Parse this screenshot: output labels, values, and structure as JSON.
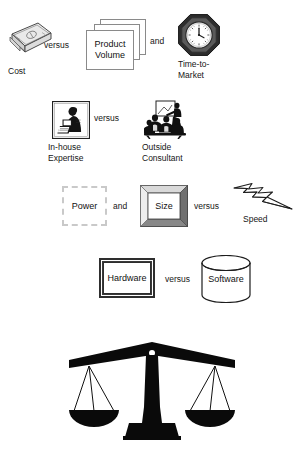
{
  "diagram": {
    "background_color": "#ffffff",
    "text_color": "#161616",
    "rows": [
      {
        "id": "row-cost-volume-time",
        "items": [
          {
            "id": "cost",
            "label": "Cost",
            "icon": "money-icon"
          },
          {
            "id": "connector-1",
            "label": "versus",
            "type": "connector"
          },
          {
            "id": "product-volume",
            "label": "Product\nVolume",
            "icon": "stacked-pages-icon"
          },
          {
            "id": "connector-2",
            "label": "and",
            "type": "connector"
          },
          {
            "id": "time-to-market",
            "label": "Time-to-\nMarket",
            "icon": "clock-icon"
          }
        ]
      },
      {
        "id": "row-expertise",
        "items": [
          {
            "id": "in-house",
            "label": "In-house\nExpertise",
            "icon": "person-at-computer-icon"
          },
          {
            "id": "connector-3",
            "label": "versus",
            "type": "connector"
          },
          {
            "id": "outside",
            "label": "Outside\nConsultant",
            "icon": "group-presentation-icon"
          }
        ]
      },
      {
        "id": "row-power-size-speed",
        "items": [
          {
            "id": "power",
            "label": "Power",
            "icon": "dashed-box-icon"
          },
          {
            "id": "connector-4",
            "label": "and",
            "type": "connector"
          },
          {
            "id": "size",
            "label": "Size",
            "icon": "beveled-frame-icon"
          },
          {
            "id": "connector-5",
            "label": "versus",
            "type": "connector"
          },
          {
            "id": "speed",
            "label": "Speed",
            "icon": "lightning-bolt-icon"
          }
        ]
      },
      {
        "id": "row-hardware-software",
        "items": [
          {
            "id": "hardware",
            "label": "Hardware",
            "icon": "double-border-box-icon"
          },
          {
            "id": "connector-6",
            "label": "versus",
            "type": "connector"
          },
          {
            "id": "software",
            "label": "Software",
            "icon": "cylinder-icon"
          }
        ]
      }
    ],
    "footer_graphic": {
      "id": "balance-scale",
      "icon": "balance-scale-icon",
      "color": "#000000"
    }
  },
  "labels": {
    "cost": "Cost",
    "product_volume": "Product\nVolume",
    "time_to_market": "Time-to-\nMarket",
    "in_house": "In-house\nExpertise",
    "outside_consultant": "Outside\nConsultant",
    "power": "Power",
    "size": "Size",
    "speed": "Speed",
    "hardware": "Hardware",
    "software": "Software"
  },
  "connectors": {
    "versus_1": "versus",
    "and_1": "and",
    "versus_2": "versus",
    "and_2": "and",
    "versus_3": "versus",
    "versus_4": "versus"
  }
}
